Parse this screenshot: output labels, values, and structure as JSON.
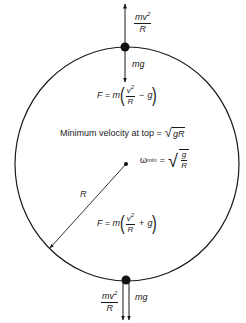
{
  "diagram": {
    "type": "vertical-circular-motion-free-body",
    "circle": {
      "cx": 126,
      "cy": 164,
      "rx": 112,
      "ry": 117
    },
    "top_point": {
      "up_force": {
        "num": "mv",
        "num_exp": "2",
        "den": "R"
      },
      "down_force": "mg",
      "net_force": {
        "lhs": "F = m",
        "num": "v",
        "num_exp": "2",
        "den": "R",
        "op": "−",
        "term": "g"
      }
    },
    "center_text": {
      "min_velocity_label": "Minimum velocity at top =",
      "min_velocity_radicand": "gR",
      "omega_symbol": "ω",
      "omega_sub": "min",
      "omega_eq": "=",
      "omega_num": "g",
      "omega_den": "R"
    },
    "radius_label": "R",
    "bottom_point": {
      "net_force": {
        "lhs": "F = m",
        "num": "v",
        "num_exp": "2",
        "den": "R",
        "op": "+",
        "term": "g"
      },
      "left_force": {
        "num": "mv",
        "num_exp": "2",
        "den": "R"
      },
      "right_force": "mg"
    }
  }
}
